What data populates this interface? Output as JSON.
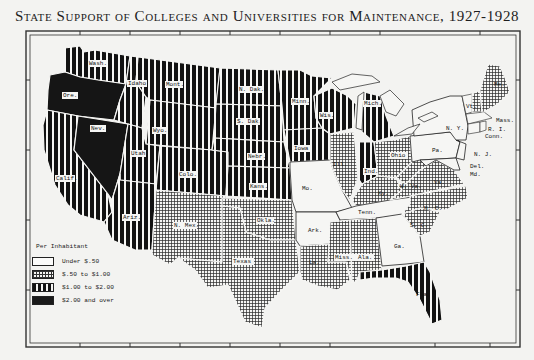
{
  "title": "State Support of Colleges and Universities for Maintenance, 1927-1928",
  "legend": {
    "heading": "Per Inhabitant",
    "items": [
      {
        "key": "under50",
        "label": "Under $.50",
        "pattern": "blank"
      },
      {
        "key": "50to100",
        "label": "$.50 to $1.00",
        "pattern": "crosshatch"
      },
      {
        "key": "100to200",
        "label": "$1.00 to $2.00",
        "pattern": "vertical-stripes"
      },
      {
        "key": "200plus",
        "label": "$2.00 and over",
        "pattern": "solid-black"
      }
    ]
  },
  "colors": {
    "ink": "#111111",
    "paper": "#f3f3f1"
  },
  "states": [
    {
      "abbr": "Wash.",
      "category": "100to200"
    },
    {
      "abbr": "Ore.",
      "category": "200plus"
    },
    {
      "abbr": "Calif.",
      "category": "100to200"
    },
    {
      "abbr": "Nev.",
      "category": "200plus"
    },
    {
      "abbr": "Idaho",
      "category": "100to200"
    },
    {
      "abbr": "Mont.",
      "category": "100to200"
    },
    {
      "abbr": "Wyo.",
      "category": "100to200"
    },
    {
      "abbr": "Utah",
      "category": "100to200"
    },
    {
      "abbr": "Ariz.",
      "category": "100to200"
    },
    {
      "abbr": "Colo.",
      "category": "100to200"
    },
    {
      "abbr": "N. Mex.",
      "category": "50to100"
    },
    {
      "abbr": "N. Dak.",
      "category": "100to200"
    },
    {
      "abbr": "S. Dak.",
      "category": "100to200"
    },
    {
      "abbr": "Nebr.",
      "category": "100to200"
    },
    {
      "abbr": "Kans.",
      "category": "100to200"
    },
    {
      "abbr": "Okla.",
      "category": "50to100"
    },
    {
      "abbr": "Texas",
      "category": "50to100"
    },
    {
      "abbr": "Minn.",
      "category": "100to200"
    },
    {
      "abbr": "Iowa",
      "category": "100to200"
    },
    {
      "abbr": "Mo.",
      "category": "under50"
    },
    {
      "abbr": "Ark.",
      "category": "under50"
    },
    {
      "abbr": "La.",
      "category": "50to100"
    },
    {
      "abbr": "Wis.",
      "category": "100to200"
    },
    {
      "abbr": "Ill.",
      "category": "50to100"
    },
    {
      "abbr": "Mich.",
      "category": "100to200"
    },
    {
      "abbr": "Ind.",
      "category": "100to200"
    },
    {
      "abbr": "Ohio",
      "category": "50to100"
    },
    {
      "abbr": "Ky.",
      "category": "50to100"
    },
    {
      "abbr": "Tenn.",
      "category": "under50"
    },
    {
      "abbr": "Miss.",
      "category": "50to100"
    },
    {
      "abbr": "Ala.",
      "category": "50to100"
    },
    {
      "abbr": "Ga.",
      "category": "under50"
    },
    {
      "abbr": "Fla.",
      "category": "100to200"
    },
    {
      "abbr": "S. C.",
      "category": "50to100"
    },
    {
      "abbr": "N. C.",
      "category": "50to100"
    },
    {
      "abbr": "Va.",
      "category": "50to100"
    },
    {
      "abbr": "W. Va.",
      "category": "50to100"
    },
    {
      "abbr": "Md.",
      "category": "under50"
    },
    {
      "abbr": "Del.",
      "category": "under50"
    },
    {
      "abbr": "Pa.",
      "category": "under50"
    },
    {
      "abbr": "N. J.",
      "category": "under50"
    },
    {
      "abbr": "N. Y.",
      "category": "under50"
    },
    {
      "abbr": "Conn.",
      "category": "under50"
    },
    {
      "abbr": "R. I.",
      "category": "under50"
    },
    {
      "abbr": "Mass.",
      "category": "under50"
    },
    {
      "abbr": "Vt.",
      "category": "under50"
    },
    {
      "abbr": "N. H.",
      "category": "50to100"
    },
    {
      "abbr": "Me.",
      "category": "50to100"
    }
  ],
  "labels": {
    "wash": "Wash.",
    "ore": "Ore.",
    "calif": "Calif.",
    "nev": "Nev.",
    "idaho": "Idaho",
    "mont": "Mont.",
    "wyo": "Wyo.",
    "utah": "Utah",
    "ariz": "Ariz.",
    "colo": "Colo.",
    "nmex": "N. Mex.",
    "ndak": "N. Dak.",
    "sdak": "S. Dak.",
    "nebr": "Nebr.",
    "kans": "Kans.",
    "okla": "Okla.",
    "texas": "Texas",
    "minn": "Minn.",
    "iowa": "Iowa",
    "mo": "Mo.",
    "ark": "Ark.",
    "la": "La.",
    "wis": "Wis.",
    "ill": "Ill.",
    "mich": "Mich.",
    "ind": "Ind.",
    "ohio": "Ohio",
    "ky": "Ky.",
    "tenn": "Tenn.",
    "miss": "Miss.",
    "ala": "Ala.",
    "ga": "Ga.",
    "fla": "Fla.",
    "sc": "S. C.",
    "nc": "N. C.",
    "va": "Va.",
    "wva": "W. Va.",
    "md": "Md.",
    "del": "Del.",
    "pa": "Pa.",
    "nj": "N. J.",
    "ny": "N. Y.",
    "conn": "Conn.",
    "ri": "R. I.",
    "mass": "Mass.",
    "vt": "Vt.",
    "me": "Me."
  }
}
